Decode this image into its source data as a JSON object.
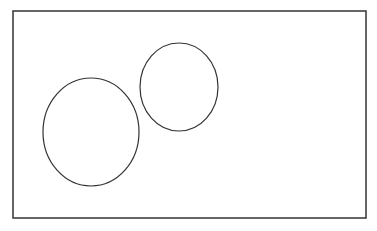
{
  "diagram": {
    "stroke_color": "#333333",
    "background": "#ffffff",
    "frame": {
      "x": 13,
      "y": 11,
      "width": 353,
      "height": 207
    },
    "shapes": [
      {
        "type": "ellipse",
        "name": "large-ellipse",
        "cx": 91,
        "cy": 132,
        "rx": 48,
        "ry": 54
      },
      {
        "type": "ellipse",
        "name": "small-ellipse",
        "cx": 179,
        "cy": 87,
        "rx": 39,
        "ry": 44
      }
    ]
  }
}
